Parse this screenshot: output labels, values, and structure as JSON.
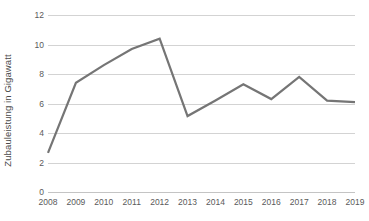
{
  "chart_data": {
    "type": "line",
    "title": "",
    "xlabel": "",
    "ylabel": "Zubauleistung in Gigawatt",
    "categories": [
      "2008",
      "2009",
      "2010",
      "2011",
      "2012",
      "2013",
      "2014",
      "2015",
      "2016",
      "2017",
      "2018",
      "2019"
    ],
    "values": [
      2.65,
      7.4,
      8.6,
      9.7,
      10.4,
      5.15,
      6.2,
      7.3,
      6.3,
      7.8,
      6.2,
      6.1
    ],
    "series": [
      {
        "name": "Zubauleistung",
        "values": [
          2.65,
          7.4,
          8.6,
          9.7,
          10.4,
          5.15,
          6.2,
          7.3,
          6.3,
          7.8,
          6.2,
          6.1
        ]
      }
    ],
    "ylim": [
      0,
      12
    ],
    "yticks": [
      0,
      2,
      4,
      6,
      8,
      10,
      12
    ],
    "ytick_labels": [
      "0",
      "2",
      "4",
      "6",
      "8",
      "10",
      "12"
    ],
    "grid": true,
    "grid_axis": "y",
    "legend": false,
    "legend_position": "none",
    "line_color": "#757575",
    "line_width": 2.2,
    "grid_color": "#d3d3d3",
    "background_color": "#ffffff",
    "text_color": "#5a5a5a"
  }
}
